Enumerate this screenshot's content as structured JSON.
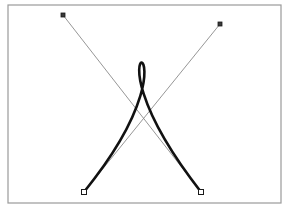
{
  "app": {
    "title": "Bezier Curve Canvas",
    "background_color": "#ffffff"
  },
  "frame": {
    "name": "canvas-frame",
    "x": 8,
    "y": 5,
    "width": 273,
    "height": 198,
    "stroke_color": "#9a9a9a",
    "stroke_width": 1.2,
    "fill_color": "#ffffff"
  },
  "curve": {
    "name": "cubic-bezier-with-loop",
    "stroke_color": "#111111",
    "stroke_width": 2.6,
    "path": "M 84 192 C 220 24 63 15 201 192",
    "description": "Cubic Bezier with crossed control handles producing a narrow teardrop loop near the top"
  },
  "loop": {
    "name": "loop-apex",
    "top_y": 61,
    "left_x": 138,
    "right_x": 146,
    "crossing_point": {
      "x": 142,
      "y": 90
    }
  },
  "handle_lines": [
    {
      "name": "handle-line-left",
      "x1": 63,
      "y1": 15,
      "x2": 201,
      "y2": 192,
      "stroke_color": "#8a8a8a",
      "stroke_width": 0.9
    },
    {
      "name": "handle-line-right",
      "x1": 220,
      "y1": 24,
      "x2": 84,
      "y2": 192,
      "stroke_color": "#8a8a8a",
      "stroke_width": 0.9
    }
  ],
  "control_points": [
    {
      "name": "control-point-left",
      "x": 63,
      "y": 15,
      "size": 4,
      "style": "filled-square",
      "fill_color": "#3a3a3a",
      "stroke_color": "#1a1a1a"
    },
    {
      "name": "control-point-right",
      "x": 220,
      "y": 24,
      "size": 4,
      "style": "filled-square",
      "fill_color": "#3a3a3a",
      "stroke_color": "#1a1a1a"
    }
  ],
  "anchor_points": [
    {
      "name": "anchor-point-start",
      "x": 84,
      "y": 192,
      "size": 5,
      "style": "hollow-square",
      "fill_color": "#ffffff",
      "stroke_color": "#1a1a1a"
    },
    {
      "name": "anchor-point-end",
      "x": 201,
      "y": 192,
      "size": 5,
      "style": "hollow-square",
      "fill_color": "#ffffff",
      "stroke_color": "#1a1a1a"
    }
  ],
  "handle_line_crossing": {
    "x": 142,
    "y": 123
  }
}
